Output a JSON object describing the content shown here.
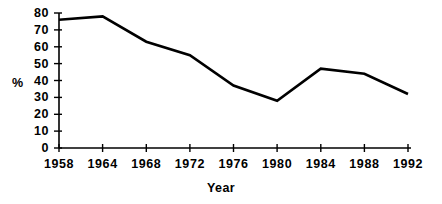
{
  "chart_data": {
    "type": "line",
    "title": "",
    "subtitle": "",
    "xlabel": "Year",
    "ylabel": "%",
    "categories": [
      "1958",
      "1964",
      "1968",
      "1972",
      "1976",
      "1980",
      "1984",
      "1988",
      "1992"
    ],
    "x": [
      1958,
      1964,
      1968,
      1972,
      1976,
      1980,
      1984,
      1988,
      1992
    ],
    "values": [
      76,
      78,
      63,
      55,
      37,
      28,
      47,
      44,
      32
    ],
    "series": [
      {
        "name": "",
        "values": [
          76,
          78,
          63,
          55,
          37,
          28,
          47,
          44,
          32
        ]
      }
    ],
    "ylim": [
      0,
      80
    ],
    "yticks": [
      0,
      10,
      20,
      30,
      40,
      50,
      60,
      70,
      80
    ],
    "ytick_labels": [
      "0",
      "10",
      "20",
      "30",
      "40",
      "50",
      "60",
      "70",
      "80"
    ],
    "xtick_labels": [
      "1958",
      "1964",
      "1968",
      "1972",
      "1976",
      "1980",
      "1984",
      "1988",
      "1992"
    ],
    "grid": false,
    "legend": false,
    "legend_position": "none",
    "line_color": "#000000",
    "axis_color": "#000000",
    "background_color": "#ffffff",
    "annotations": []
  },
  "axes": {
    "y_title": "%",
    "x_title": "Year"
  }
}
